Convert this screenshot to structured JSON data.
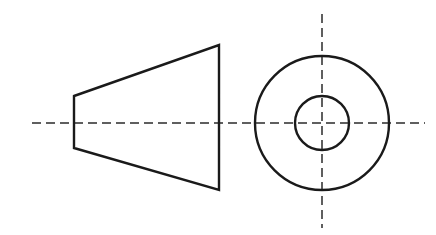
{
  "drawing": {
    "title": "Orthographic projection of a truncated cone",
    "background_color": "#ffffff",
    "outline_color": "#1a1a1a",
    "centerline_color": "#2b2b2b",
    "outline_stroke_width": 2.4,
    "centerline_stroke_width": 1.5,
    "centerline_dash_pattern": "9 5",
    "canvas": {
      "width": 436,
      "height": 235
    },
    "views": {
      "front_view": {
        "name": "front-view",
        "shape": "trapezoid",
        "description": "Isosceles trapezoid representing the side profile of a truncated cone",
        "points": "74,96 219,45 219,190 74,148",
        "left_edge_x": 74,
        "left_edge_top_y": 96,
        "left_edge_bottom_y": 148,
        "left_edge_length": 52,
        "right_edge_x": 219,
        "right_edge_top_y": 45,
        "right_edge_bottom_y": 190,
        "right_edge_length": 145,
        "axial_length": 145
      },
      "end_view": {
        "name": "end-view",
        "shape": "concentric-circles",
        "description": "Two concentric circles representing the end view of a truncated cone",
        "center_x": 322,
        "center_y": 123,
        "outer_circle": {
          "name": "outer-circle",
          "radius": 67,
          "diameter": 134
        },
        "inner_circle": {
          "name": "inner-circle",
          "radius": 27,
          "diameter": 54
        }
      }
    },
    "centerlines": {
      "horizontal": {
        "name": "horizontal-centerline",
        "x1": 32,
        "y1": 123,
        "x2": 425,
        "y2": 123
      },
      "vertical": {
        "name": "vertical-centerline",
        "x1": 322,
        "y1": 14,
        "x2": 322,
        "y2": 228
      }
    }
  }
}
